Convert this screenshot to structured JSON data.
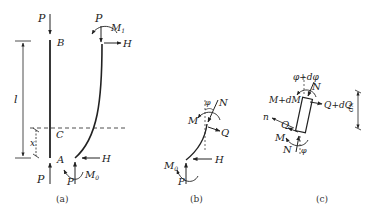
{
  "figure": {
    "panels": [
      {
        "id": "a",
        "caption": "(a)",
        "labels": {
          "P_top": "P",
          "B": "B",
          "l": "l",
          "C": "C",
          "x": "x",
          "A": "A",
          "P_bottom": "P",
          "P_deformed_top": "P",
          "M1": "M",
          "M1_sub": "1",
          "H_top": "H",
          "H_bottom": "H",
          "P_deformed_bottom": "P",
          "M0": "M",
          "M0_sub": "0"
        }
      },
      {
        "id": "b",
        "caption": "(b)",
        "labels": {
          "phi": "φ",
          "N": "N",
          "M": "M",
          "Q": "Q",
          "H": "H",
          "M0": "M",
          "M0_sub": "0",
          "P": "P"
        }
      },
      {
        "id": "c",
        "caption": "(c)",
        "labels": {
          "phi_dphi": "φ+dφ",
          "N_top": "N",
          "M_dM": "M+dM",
          "Q_dQ": "Q+dQ",
          "dx": "dx",
          "n": "n",
          "Q": "Q",
          "M": "M",
          "N_bottom": "N",
          "phi": "φ"
        }
      }
    ]
  }
}
